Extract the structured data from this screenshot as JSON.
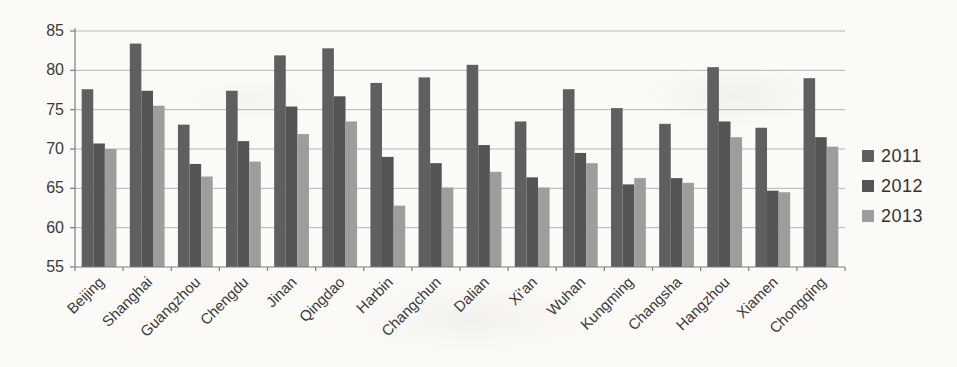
{
  "chart_data": {
    "type": "bar",
    "categories": [
      "Beijing",
      "Shanghai",
      "Guangzhou",
      "Chengdu",
      "Jinan",
      "Qingdao",
      "Harbin",
      "Changchun",
      "Dalian",
      "Xi'an",
      "Wuhan",
      "Kungming",
      "Changsha",
      "Hangzhou",
      "Xiamen",
      "Chongqing"
    ],
    "series": [
      {
        "name": "2011",
        "color": "#5f5f5f",
        "values": [
          77.6,
          83.4,
          73.1,
          77.4,
          81.9,
          82.8,
          78.4,
          79.1,
          80.7,
          73.5,
          77.6,
          75.2,
          73.2,
          80.4,
          72.7,
          79.0
        ]
      },
      {
        "name": "2012",
        "color": "#545454",
        "values": [
          70.7,
          77.4,
          68.1,
          71.0,
          75.4,
          76.7,
          69.0,
          68.2,
          70.5,
          66.4,
          69.5,
          65.5,
          66.3,
          73.5,
          64.7,
          71.5
        ]
      },
      {
        "name": "2013",
        "color": "#9d9d9d",
        "values": [
          70.0,
          75.5,
          66.5,
          68.4,
          71.9,
          73.5,
          62.8,
          65.1,
          67.1,
          65.1,
          68.2,
          66.3,
          65.7,
          71.5,
          64.5,
          70.3
        ]
      }
    ],
    "ylim": [
      55,
      85
    ],
    "yticks": [
      55,
      60,
      65,
      70,
      75,
      80,
      85
    ],
    "grid": "horizontal-major",
    "legend_position": "right",
    "x_label_rotation_deg": 45,
    "axis_color": "#7d7d7d",
    "grid_color": "#b6b6b6",
    "text_color": "#3a3a3a",
    "background": "#fbfaf7"
  }
}
